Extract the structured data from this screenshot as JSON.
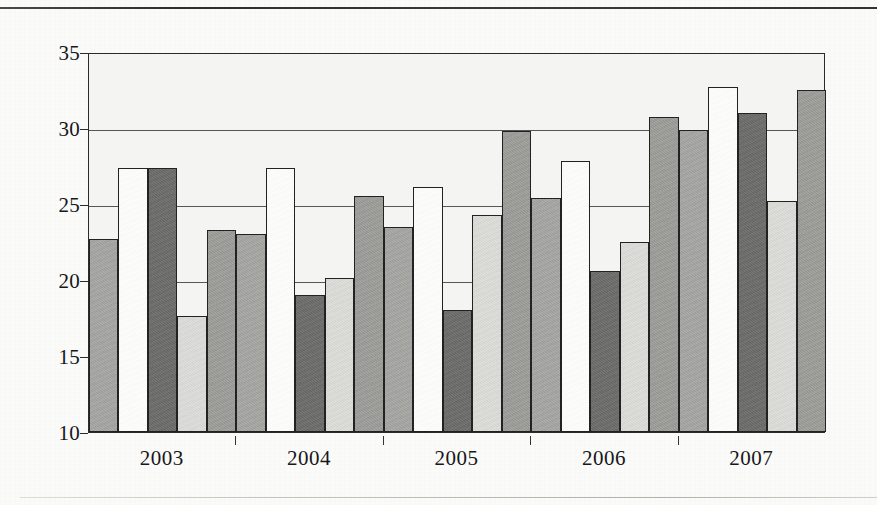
{
  "chart_data": {
    "type": "bar",
    "title": "",
    "subtitle": "",
    "xlabel": "",
    "ylabel": "",
    "categories": [
      "2003",
      "2004",
      "2005",
      "2006",
      "2007"
    ],
    "ylim": [
      10,
      35
    ],
    "yticks": [
      10,
      15,
      20,
      25,
      30,
      35
    ],
    "ytick_labels": [
      "10",
      "15",
      "20",
      "25",
      "30",
      "35"
    ],
    "grid": true,
    "grid_axis": "y",
    "legend": "none",
    "series": [
      {
        "name": "Series 1",
        "color": "#a7a7a4",
        "values": [
          22.7,
          23.0,
          23.5,
          25.4,
          29.9
        ]
      },
      {
        "name": "Series 2",
        "color": "#fdfdfb",
        "values": [
          27.4,
          27.4,
          26.1,
          27.8,
          32.7
        ]
      },
      {
        "name": "Series 3",
        "color": "#6f6f6d",
        "values": [
          27.4,
          19.0,
          18.0,
          20.6,
          31.0
        ]
      },
      {
        "name": "Series 4",
        "color": "#dcdcd8",
        "values": [
          17.6,
          20.1,
          24.3,
          22.5,
          25.2
        ]
      },
      {
        "name": "Series 5",
        "color": "#9e9e9b",
        "values": [
          23.3,
          25.5,
          29.8,
          30.7,
          32.5
        ]
      }
    ]
  },
  "figure": {
    "rule_top": "horizontal-rule",
    "rule_bottom": "horizontal-rule"
  }
}
